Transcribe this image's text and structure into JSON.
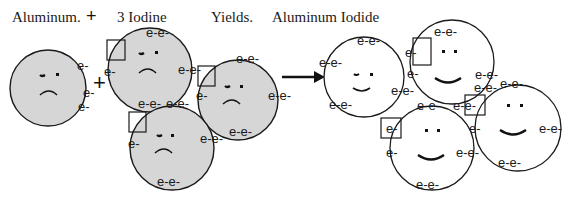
{
  "header": {
    "reactant1": "Aluminum.",
    "plus": "+",
    "reactant2": "3 Iodine",
    "yields": "Yields.",
    "product": "Aluminum Iodide"
  },
  "colors": {
    "reactant_fill": "#d6d6d6",
    "product_fill": "#ffffff",
    "stroke": "#1a1a1a"
  },
  "electron_label": "e-",
  "electron_pair_label": "e-e-",
  "reactants": {
    "aluminum": {
      "name": "Aluminum atom",
      "face": "sad",
      "valence_electrons": 3
    },
    "iodine": [
      {
        "name": "Iodine atom 1",
        "face": "sad",
        "valence_electrons": 7,
        "vacancy_box": true
      },
      {
        "name": "Iodine atom 2",
        "face": "sad",
        "valence_electrons": 7,
        "vacancy_box": true
      },
      {
        "name": "Iodine atom 3",
        "face": "sad",
        "valence_electrons": 7,
        "vacancy_box": true
      }
    ]
  },
  "products": {
    "aluminum": {
      "name": "Aluminum ion",
      "face": "happy"
    },
    "iodine": [
      {
        "name": "Iodide ion 1",
        "face": "happy"
      },
      {
        "name": "Iodide ion 2",
        "face": "happy"
      },
      {
        "name": "Iodide ion 3",
        "face": "happy"
      }
    ]
  },
  "arrow": {
    "direction": "right"
  }
}
